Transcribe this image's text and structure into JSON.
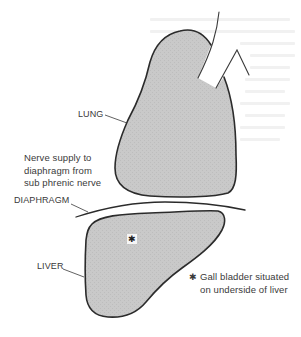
{
  "figure": {
    "labels": {
      "lung": "LUNG",
      "diaphragm": "DIAPHRAGM",
      "liver": "LIVER",
      "nerve_note": [
        "Nerve supply to",
        "diaphragm from",
        "sub phrenic nerve"
      ],
      "gall_bladder_marker": "✱",
      "gall_bladder_note": [
        "Gall bladder situated",
        "on underside of liver"
      ],
      "liver_marker": "✱"
    },
    "colors": {
      "organ_fill": "#c9c9c9",
      "outline": "#2b2b2b",
      "text": "#3a3a3a",
      "background": "#ffffff"
    }
  }
}
